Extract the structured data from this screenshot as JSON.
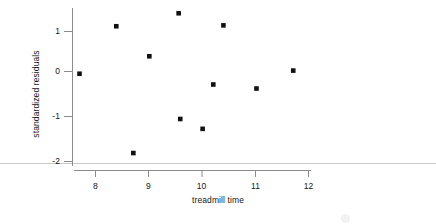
{
  "chart_data": {
    "type": "scatter",
    "title": "",
    "xlabel": "treadmill time",
    "ylabel": "standardized residuals",
    "xlim": [
      7.45,
      12.3
    ],
    "ylim": [
      -2.05,
      1.55
    ],
    "xticks": [
      8,
      9,
      10,
      11,
      12
    ],
    "xtick_labels": [
      "8",
      "9",
      "10",
      "11",
      "12"
    ],
    "yticks": [
      1,
      0,
      -1,
      -2
    ],
    "ytick_labels": [
      "1",
      "0",
      "-1",
      "-2"
    ],
    "grid": false,
    "legend": null,
    "marker": "filled-square",
    "marker_color": "#111111",
    "axis_color": "#8c8c8c",
    "x": [
      7.7,
      8.39,
      8.71,
      9.01,
      9.56,
      9.59,
      10.01,
      10.21,
      10.4,
      11.02,
      11.71
    ],
    "y": [
      -0.05,
      1.01,
      -1.82,
      0.34,
      1.3,
      -1.06,
      -1.28,
      -0.29,
      1.03,
      -0.38,
      0.02
    ],
    "points": [
      {
        "x": 7.7,
        "y": -0.05
      },
      {
        "x": 8.39,
        "y": 1.01
      },
      {
        "x": 8.71,
        "y": -1.82
      },
      {
        "x": 9.01,
        "y": 0.34
      },
      {
        "x": 9.56,
        "y": 1.3
      },
      {
        "x": 9.59,
        "y": -1.06
      },
      {
        "x": 10.01,
        "y": -1.28
      },
      {
        "x": 10.21,
        "y": -0.29
      },
      {
        "x": 10.4,
        "y": 1.03
      },
      {
        "x": 11.02,
        "y": -0.38
      },
      {
        "x": 11.71,
        "y": 0.02
      }
    ]
  },
  "axes": {
    "x_axis_label": "treadmill time",
    "y_axis_label": "standardized residuals",
    "x_tick_labels": [
      "8",
      "9",
      "10",
      "11",
      "12"
    ],
    "y_tick_labels": [
      "1",
      "0",
      "-1",
      "-2"
    ]
  }
}
